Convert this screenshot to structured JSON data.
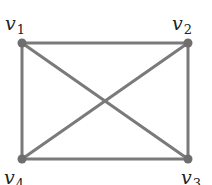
{
  "diagram": {
    "type": "graph",
    "name": "complete graph K4",
    "colors": {
      "edge": "#7a7a7a",
      "node": "#6e6e6e",
      "label": "#222222",
      "background": "#ffffff"
    },
    "vertices": [
      {
        "id": "v1",
        "base": "v",
        "sub": "1",
        "x": 22,
        "y": 43,
        "label_x": 5,
        "label_y": 14
      },
      {
        "id": "v2",
        "base": "v",
        "sub": "2",
        "x": 188,
        "y": 43,
        "label_x": 172,
        "label_y": 14
      },
      {
        "id": "v3",
        "base": "v",
        "sub": "3",
        "x": 188,
        "y": 159,
        "label_x": 181,
        "label_y": 168
      },
      {
        "id": "v4",
        "base": "v",
        "sub": "4",
        "x": 22,
        "y": 159,
        "label_x": 4,
        "label_y": 168
      }
    ],
    "edges": [
      {
        "from": "v1",
        "to": "v2"
      },
      {
        "from": "v1",
        "to": "v4"
      },
      {
        "from": "v1",
        "to": "v3"
      },
      {
        "from": "v2",
        "to": "v3"
      },
      {
        "from": "v2",
        "to": "v4"
      },
      {
        "from": "v4",
        "to": "v3"
      }
    ]
  }
}
